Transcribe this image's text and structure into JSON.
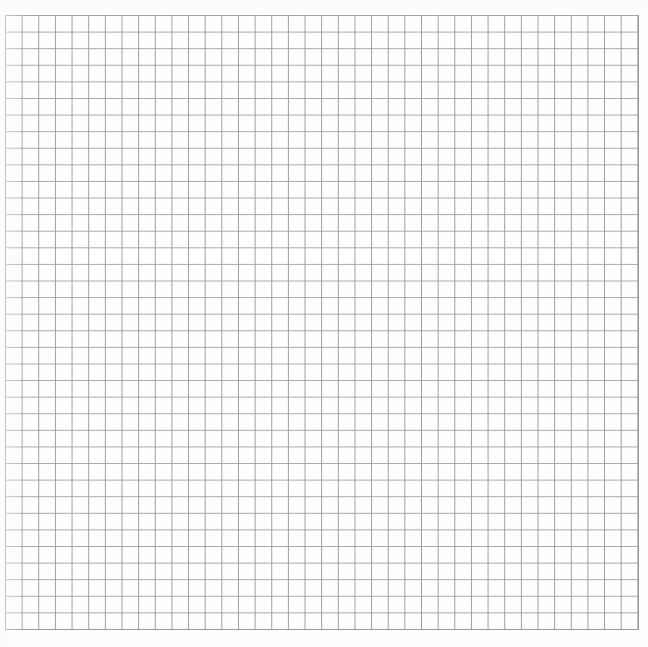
{
  "document": {
    "type": "grid-sheet",
    "title": "Blank graph paper grid",
    "caption": "",
    "page_width": 648,
    "page_height": 647,
    "background_color": "#fefefe",
    "paper_color": "#ffffff"
  },
  "grid": {
    "name": "square-grid",
    "columns": 38,
    "rows": 37,
    "cell_width": 16.65,
    "cell_height": 16.6,
    "origin_x": 5,
    "origin_y": 15,
    "width": 633,
    "height": 621,
    "line_color_vertical": "#9e9e9e",
    "line_color_horizontal": "#a9a9a9",
    "line_width": 1,
    "border_color": "#9a9a9a",
    "border_width": 1,
    "has_labels": false,
    "has_axes": false,
    "has_text": false
  },
  "chart_data": {
    "type": "table",
    "title": "",
    "xlabel": "",
    "ylabel": "",
    "categories": [],
    "values": [],
    "columns": 38,
    "rows": 37,
    "grid": true,
    "legend": "none",
    "annotations": []
  }
}
